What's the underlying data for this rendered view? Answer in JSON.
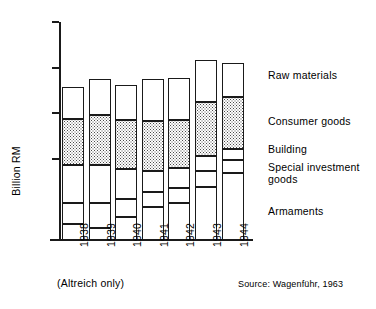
{
  "chart_data": {
    "type": "bar",
    "title": "",
    "subtitle": "",
    "xlabel": "",
    "ylabel": "Billion RM",
    "ylim": [
      0,
      80
    ],
    "yticks": [
      0,
      20,
      40,
      60,
      80
    ],
    "ytick_labels": [
      "0",
      "20",
      "40",
      "60",
      "80"
    ],
    "grid": false,
    "stacked": true,
    "legend_position": "right-inline",
    "categories": [
      "1938",
      "1939",
      "1940",
      "1941",
      "1942",
      "1943",
      "1944"
    ],
    "series": [
      {
        "name": "Armaments",
        "fill": "white",
        "values": [
          6.0,
          4.5,
          8.5,
          12.0,
          13.5,
          19.5,
          24.5
        ]
      },
      {
        "name": "Special investment goods",
        "fill": "white",
        "values": [
          7.5,
          9.0,
          6.5,
          5.5,
          5.5,
          6.0,
          5.0
        ]
      },
      {
        "name": "Building",
        "fill": "white",
        "values": [
          14.0,
          14.0,
          11.0,
          8.0,
          7.5,
          5.5,
          4.0
        ]
      },
      {
        "name": "Consumer goods",
        "fill": "dotted",
        "values": [
          17.0,
          18.5,
          18.0,
          18.0,
          17.5,
          19.5,
          19.0
        ]
      },
      {
        "name": "Raw materials",
        "fill": "white",
        "values": [
          11.5,
          13.0,
          13.0,
          15.5,
          15.5,
          15.5,
          12.5
        ]
      }
    ],
    "totals": [
      56.0,
      59.0,
      57.0,
      59.0,
      59.5,
      66.0,
      65.0
    ],
    "annotations": {
      "altreich": "(Altreich only)",
      "source": "Source: Wagenführ, 1963"
    },
    "legend_entries": [
      {
        "label": "Raw materials"
      },
      {
        "label": "Consumer goods"
      },
      {
        "label": "Building"
      },
      {
        "label": "Special investment\ngoods"
      },
      {
        "label": "Armaments"
      }
    ]
  },
  "axis": {
    "y_title": "Billion RM",
    "y_ticks": [
      {
        "label": "80"
      },
      {
        "label": "60"
      },
      {
        "label": "40"
      },
      {
        "label": "20"
      },
      {
        "label": "0"
      }
    ],
    "x_ticks": [
      {
        "label": "1938"
      },
      {
        "label": "1939"
      },
      {
        "label": "1940"
      },
      {
        "label": "1941"
      },
      {
        "label": "1942"
      },
      {
        "label": "1943"
      },
      {
        "label": "1944"
      }
    ]
  },
  "legend": {
    "items": [
      {
        "label": "Raw materials"
      },
      {
        "label": "Consumer goods"
      },
      {
        "label": "Building"
      },
      {
        "label": "Special investment"
      },
      {
        "label": "goods"
      },
      {
        "label": "Armaments"
      }
    ]
  },
  "notes": {
    "altreich": "(Altreich only)",
    "source": "Source: Wagenführ, 1963"
  },
  "colors": {
    "ink": "#1a1a1a",
    "paper": "#ffffff",
    "hatch": "#4a4a4a"
  }
}
